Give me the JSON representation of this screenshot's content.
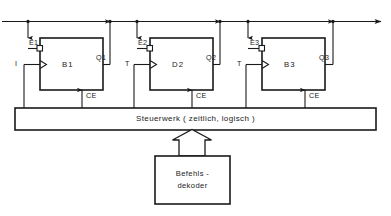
{
  "diagram": {
    "colors": {
      "line": "#1a1a1a",
      "background": "#ffffff",
      "text": "#1a1a1a"
    },
    "bus": {
      "name": "data-bus",
      "direction": "right",
      "arrow_end": "right-arrow"
    },
    "blocks": [
      {
        "id": "block-1",
        "label": "B1",
        "enable_label": "E1",
        "output_label": "Q1",
        "clock_label": "CE",
        "input_label": "I"
      },
      {
        "id": "block-2",
        "label": "D2",
        "enable_label": "E2",
        "output_label": "Q2",
        "clock_label": "CE",
        "input_label": "T"
      },
      {
        "id": "block-3",
        "label": "B3",
        "enable_label": "E3",
        "output_label": "Q3",
        "clock_label": "CE",
        "input_label": "T"
      }
    ],
    "control_unit": {
      "label": "Steuerwerk ( zeitlich, logisch )"
    },
    "decoder": {
      "line1": "Befehls -",
      "line2": "dekoder"
    }
  }
}
